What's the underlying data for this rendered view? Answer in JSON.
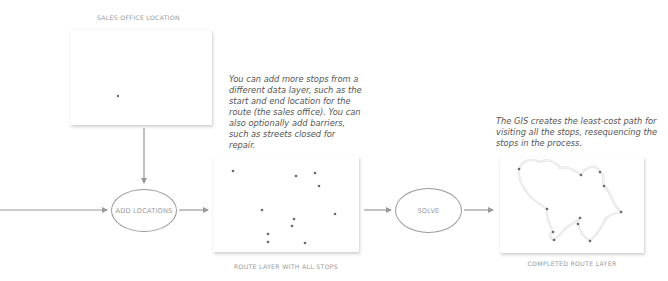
{
  "diagram": {
    "frames": {
      "sales_office": {
        "caption": "SALES OFFICE LOCATION",
        "stops": [
          [
            118,
            96
          ]
        ]
      },
      "route_layer": {
        "caption": "ROUTE LAYER WITH ALL STOPS",
        "stops": [
          [
            233,
            171
          ],
          [
            296,
            176
          ],
          [
            315,
            173
          ],
          [
            319,
            186
          ],
          [
            262,
            210
          ],
          [
            335,
            214
          ],
          [
            294,
            219
          ],
          [
            292,
            226
          ],
          [
            268,
            234
          ],
          [
            268,
            242
          ],
          [
            305,
            243
          ]
        ]
      },
      "completed_route": {
        "caption": "COMPLETED ROUTE LAYER",
        "stops": [
          [
            519,
            169
          ],
          [
            581,
            175
          ],
          [
            600,
            172
          ],
          [
            604,
            186
          ],
          [
            547,
            209
          ],
          [
            621,
            212
          ],
          [
            580,
            218
          ],
          [
            578,
            224
          ],
          [
            553,
            232
          ],
          [
            554,
            240
          ],
          [
            590,
            241
          ]
        ]
      }
    },
    "notes": {
      "add_stops": "You can add more stops from a different data layer, such as the start and end location for the route (the sales office). You can also optionally add barriers, such as streets closed for repair.",
      "solve": "The GIS creates the least-cost path for visiting all the stops, resequencing the stops in the process."
    },
    "nodes": {
      "add_locations": "ADD LOCATIONS",
      "solve": "SOLVE"
    },
    "colors": {
      "line": "#999999",
      "stop": "#6a6a6a",
      "route": "#e4e4e4"
    }
  }
}
